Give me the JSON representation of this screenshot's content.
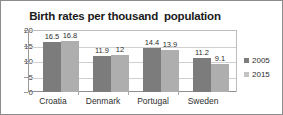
{
  "chart_data": {
    "type": "bar",
    "title": "Birth rates per thousand  population",
    "xlabel": "",
    "ylabel": "",
    "ylim": [
      0,
      20
    ],
    "yticks": [
      0,
      5,
      10,
      15,
      20
    ],
    "grid": true,
    "legend_position": "right",
    "categories": [
      "Croatia",
      "Denmark",
      "Portugal",
      "Sweden"
    ],
    "series": [
      {
        "name": "2005",
        "color": "#7c7c7c",
        "values": [
          16.5,
          11.9,
          14.4,
          11.2
        ],
        "labels": [
          "16.5",
          "11.9",
          "14.4",
          "11.2"
        ]
      },
      {
        "name": "2015",
        "color": "#aeaeae",
        "values": [
          16.8,
          12,
          13.9,
          9.1
        ],
        "labels": [
          "16.8",
          "12",
          "13.9",
          "9.1"
        ]
      }
    ]
  },
  "ytick_labels": [
    "20",
    "15",
    "10",
    "5",
    "0"
  ],
  "legend": {
    "items": [
      {
        "label": "2005",
        "color": "#7c7c7c"
      },
      {
        "label": "2015",
        "color": "#c3c3c3"
      }
    ]
  }
}
